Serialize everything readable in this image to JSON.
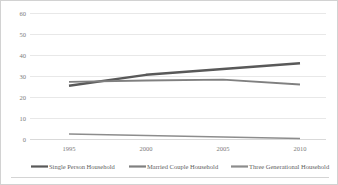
{
  "chart_data": {
    "type": "line",
    "title": "",
    "xlabel": "",
    "ylabel": "",
    "x": [
      1995,
      2000,
      2005,
      2010
    ],
    "xtick_labels": [
      "1995",
      "2000",
      "2005",
      "2010"
    ],
    "ytick_labels": [
      "0",
      "10",
      "20",
      "30",
      "40",
      "50",
      "60"
    ],
    "yticks": [
      0,
      10,
      20,
      30,
      40,
      50,
      60
    ],
    "ylim": [
      0,
      60
    ],
    "xlim": [
      1995,
      2010
    ],
    "grid": "horizontal",
    "legend_position": "bottom",
    "series": [
      {
        "name": "Single Person Household",
        "values": [
          25.6,
          30.8,
          33.6,
          36.3
        ],
        "color": "#595959"
      },
      {
        "name": "Married Couple Household",
        "values": [
          27.4,
          28.1,
          28.5,
          26.2
        ],
        "color": "#808080"
      },
      {
        "name": "Three Generational Household",
        "values": [
          2.6,
          1.9,
          1.2,
          0.5
        ],
        "color": "#8c8c8c"
      }
    ]
  },
  "legend": {
    "items": [
      {
        "label": "Single Person Household",
        "color": "#595959"
      },
      {
        "label": "Married Couple Household",
        "color": "#808080"
      },
      {
        "label": "Three Generational Household",
        "color": "#8c8c8c"
      }
    ]
  },
  "axes": {
    "y_ticks": [
      "60",
      "50",
      "40",
      "30",
      "20",
      "10",
      "0"
    ],
    "x_ticks": [
      "1995",
      "2000",
      "2005",
      "2010"
    ]
  },
  "colors": {
    "grid": "#e8e8e8",
    "axis": "#d9d9d9",
    "border": "#d2d2d2",
    "tick_text": "#7b7b7b",
    "legend_text": "#5e5e5e",
    "background": "#ffffff"
  }
}
